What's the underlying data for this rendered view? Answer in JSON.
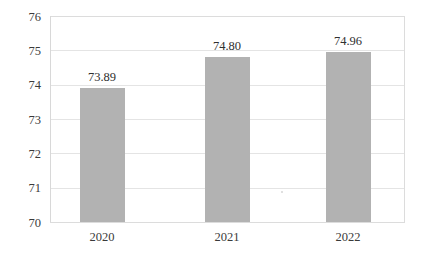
{
  "chart_data": {
    "type": "bar",
    "title": "",
    "subtitle": "",
    "xlabel": "",
    "ylabel": "",
    "categories": [
      "2020",
      "2021",
      "2022"
    ],
    "values": [
      73.89,
      74.8,
      74.96
    ],
    "value_labels": [
      "73.89",
      "74.80",
      "74.96"
    ],
    "series": [
      {
        "name": "",
        "values": [
          73.89,
          74.8,
          74.96
        ]
      }
    ],
    "ylim": [
      70,
      76
    ],
    "ytick_values": [
      70,
      71,
      72,
      73,
      74,
      75,
      76
    ],
    "ytick_labels": [
      "70",
      "71",
      "72",
      "73",
      "74",
      "75",
      "76"
    ],
    "xtick_labels": [
      "2020",
      "2021",
      "2022"
    ],
    "grid": true,
    "grid_axis": "y",
    "legend": false,
    "legend_position": "none",
    "bar_color": "#b2b2b2",
    "grid_color": "#e4e4e4",
    "frame_color": "#dcdcdc",
    "text_color": "#3a3a3a",
    "background_color": "#ffffff",
    "data_labels_shown": true
  },
  "plot": {
    "left": 50,
    "right": 404,
    "top": 16,
    "bottom": 222,
    "bar_width": 45,
    "bar_centers": [
      102,
      227,
      348
    ]
  },
  "labels": {
    "y_axis_name": "y-axis",
    "x_axis_name": "x-axis"
  }
}
